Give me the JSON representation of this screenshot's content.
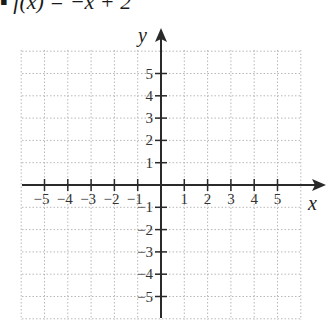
{
  "title": "▪ f(x) = −x + 2",
  "axes": {
    "x_label": "x",
    "y_label": "y",
    "x_ticks": [
      "−5",
      "−4",
      "−3",
      "−2",
      "−1",
      "1",
      "2",
      "3",
      "4",
      "5"
    ],
    "y_ticks": [
      "5",
      "4",
      "3",
      "2",
      "1",
      "−1",
      "−2",
      "−3",
      "−4",
      "−5"
    ],
    "x_range": [
      -6,
      6
    ],
    "y_range": [
      -6,
      6
    ]
  },
  "grid": {
    "style": "dotted",
    "color": "#b5b5b5",
    "spacing": 1
  }
}
